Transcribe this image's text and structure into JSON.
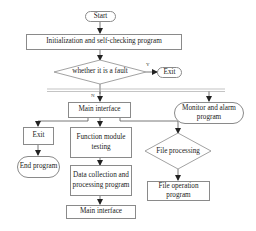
{
  "diagram": {
    "type": "flowchart",
    "nodes": {
      "start": {
        "label": "Start",
        "shape": "terminator"
      },
      "init": {
        "label": "Initialization and self-checking program",
        "shape": "process"
      },
      "fault_check": {
        "label": "whether it is a fault",
        "shape": "decision"
      },
      "exit_top": {
        "label": "Exit",
        "shape": "terminator"
      },
      "main_interface": {
        "label": "Main interface",
        "shape": "process"
      },
      "monitor": {
        "label": "Monitor and alarm program",
        "shape": "terminator"
      },
      "exit_left": {
        "label": "Exit",
        "shape": "process"
      },
      "end_program": {
        "label": "End program",
        "shape": "terminator"
      },
      "function_testing": {
        "label": "Function module testing",
        "shape": "process"
      },
      "data_collection": {
        "label": "Data collection and processing program",
        "shape": "process"
      },
      "main_interface_bottom": {
        "label": "Main interface",
        "shape": "process"
      },
      "file_processing": {
        "label": "File processing",
        "shape": "decision"
      },
      "file_operation": {
        "label": "File operation program",
        "shape": "process"
      }
    },
    "edge_labels": {
      "yes": "Y",
      "no": "N"
    },
    "edges": [
      {
        "from": "start",
        "to": "init"
      },
      {
        "from": "init",
        "to": "fault_check"
      },
      {
        "from": "fault_check",
        "to": "exit_top",
        "label": "Y"
      },
      {
        "from": "fault_check",
        "to": "parallel_bar",
        "label": "N"
      },
      {
        "from": "parallel_bar",
        "to": "main_interface"
      },
      {
        "from": "parallel_bar",
        "to": "monitor"
      },
      {
        "from": "main_interface",
        "to": "exit_left"
      },
      {
        "from": "main_interface",
        "to": "function_testing"
      },
      {
        "from": "main_interface",
        "to": "file_processing"
      },
      {
        "from": "exit_left",
        "to": "end_program"
      },
      {
        "from": "function_testing",
        "to": "data_collection"
      },
      {
        "from": "data_collection",
        "to": "main_interface_bottom"
      },
      {
        "from": "file_processing",
        "to": "file_operation"
      }
    ],
    "colors": {
      "line": "#555555",
      "border": "#8a8a8a",
      "text": "#222222"
    }
  }
}
